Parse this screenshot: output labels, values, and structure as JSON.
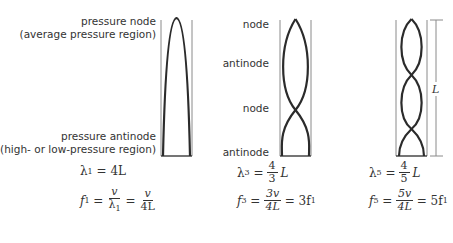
{
  "labels": {
    "tube1_top_line1": "pressure node",
    "tube1_top_line2": "(average pressure region)",
    "tube1_bottom_line1": "pressure antinode",
    "tube1_bottom_line2": "(high- or low-pressure region)",
    "tube2_labels": [
      "node",
      "antinode",
      "node",
      "antinode"
    ],
    "length_label": "L"
  },
  "equations": {
    "tube1": {
      "wavelength_lhs": "λ",
      "wavelength_sub": "1",
      "wavelength_rhs": "= 4L",
      "freq_lhs": "f",
      "freq_sub": "1",
      "frac1_num": "v",
      "frac1_den": "λ",
      "frac1_den_sub": "1",
      "frac2_num": "v",
      "frac2_den": "4L"
    },
    "tube2": {
      "wavelength_lhs": "λ",
      "wavelength_sub": "3",
      "frac_num": "4",
      "frac_den": "3",
      "frac_suffix": "L",
      "freq_lhs": "f",
      "freq_sub": "3",
      "ffrac_num": "3v",
      "ffrac_den": "4L",
      "result": "= 3f",
      "result_sub": "1"
    },
    "tube3": {
      "wavelength_lhs": "λ",
      "wavelength_sub": "5",
      "frac_num": "4",
      "frac_den": "5",
      "frac_suffix": "L",
      "freq_lhs": "f",
      "freq_sub": "5",
      "ffrac_num": "5v",
      "ffrac_den": "4L",
      "result": "= 5f",
      "result_sub": "1"
    }
  },
  "colors": {
    "wave": "#2b2b2b",
    "wall": "#8a8a8a",
    "text": "#333333"
  }
}
